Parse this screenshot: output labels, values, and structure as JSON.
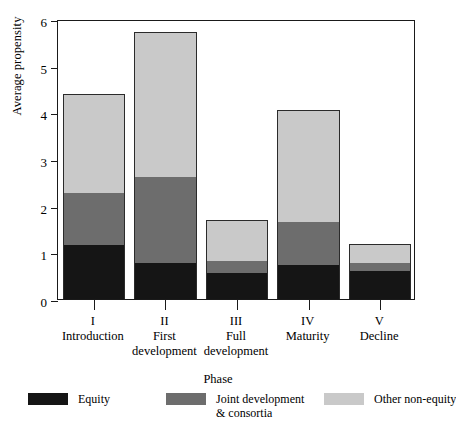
{
  "chart_data": {
    "type": "bar",
    "subtype": "stacked-vertical",
    "title": "",
    "xlabel": "Phase",
    "ylabel": "Average propensity",
    "ylim": [
      0,
      6
    ],
    "yticks": [
      0,
      1,
      2,
      3,
      4,
      5,
      6
    ],
    "ytick_labels": [
      "0",
      "1",
      "2",
      "3",
      "4",
      "5",
      "6"
    ],
    "grid": false,
    "legend_position": "bottom-left",
    "categories": [
      "I",
      "II",
      "III",
      "IV",
      "V"
    ],
    "category_names": [
      "Introduction",
      "First development",
      "Full development",
      "Maturity",
      "Decline"
    ],
    "category_name_lines": [
      [
        "Introduction"
      ],
      [
        "First",
        "development"
      ],
      [
        "Full",
        "development"
      ],
      [
        "Maturity"
      ],
      [
        "Decline"
      ]
    ],
    "series": [
      {
        "name": "Equity",
        "color": "#151515",
        "values": [
          1.15,
          0.78,
          0.56,
          0.73,
          0.6
        ]
      },
      {
        "name": "Joint development & consortia",
        "name_lines": [
          "Joint development",
          "& consortia"
        ],
        "color": "#6d6d6d",
        "values": [
          1.13,
          1.84,
          0.26,
          0.93,
          0.17
        ]
      },
      {
        "name": "Other non-equity",
        "name_lines": [
          "Other non-equity"
        ],
        "color": "#c9c9c9",
        "values": [
          2.12,
          3.1,
          0.88,
          2.38,
          0.41
        ]
      }
    ],
    "totals": [
      4.4,
      5.72,
      1.7,
      4.04,
      1.18
    ]
  },
  "axes": {
    "y_title": "Average propensity",
    "x_title": "Phase",
    "y_tick_0": "0",
    "y_tick_1": "1",
    "y_tick_2": "2",
    "y_tick_3": "3",
    "y_tick_4": "4",
    "y_tick_5": "5",
    "y_tick_6": "6"
  },
  "x_categories": [
    {
      "roman": "I",
      "line1": "Introduction",
      "line2": ""
    },
    {
      "roman": "II",
      "line1": "First",
      "line2": "development"
    },
    {
      "roman": "III",
      "line1": "Full",
      "line2": "development"
    },
    {
      "roman": "IV",
      "line1": "Maturity",
      "line2": ""
    },
    {
      "roman": "V",
      "line1": "Decline",
      "line2": ""
    }
  ],
  "legend": {
    "items": [
      {
        "label_line1": "Equity",
        "label_line2": "",
        "color": "#151515"
      },
      {
        "label_line1": "Joint development",
        "label_line2": "& consortia",
        "color": "#6d6d6d"
      },
      {
        "label_line1": "Other non-equity",
        "label_line2": "",
        "color": "#c9c9c9"
      }
    ]
  },
  "colors": {
    "equity": "#151515",
    "joint_development": "#6d6d6d",
    "other_non_equity": "#c9c9c9",
    "axis": "#1a1a1a",
    "background": "#ffffff"
  }
}
